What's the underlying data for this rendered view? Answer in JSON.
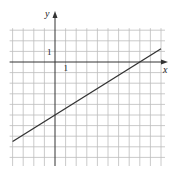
{
  "chart_data": {
    "type": "line",
    "title": "",
    "xlabel": "x",
    "ylabel": "y",
    "xlim": [
      -4,
      10
    ],
    "ylim": [
      -10,
      3
    ],
    "grid": true,
    "grid_step": 1,
    "tick_labels": {
      "x": "1",
      "y": "1"
    },
    "series": [
      {
        "name": "line",
        "equation": "y = (5/8)x - 5",
        "x": [
          -4,
          10
        ],
        "y": [
          -7.5,
          1.25
        ],
        "slope": 0.625,
        "y_intercept": -5,
        "x_intercept": 8
      }
    ]
  },
  "colors": {
    "grid": "#bdbdbd",
    "axis": "#333333",
    "line": "#333333"
  }
}
